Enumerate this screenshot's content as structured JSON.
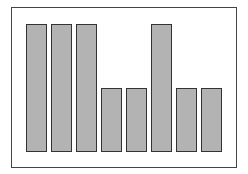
{
  "chart_data": {
    "type": "bar",
    "title": "",
    "xlabel": "",
    "ylabel": "",
    "categories": [
      "1",
      "2",
      "3",
      "4",
      "5",
      "6",
      "7",
      "8"
    ],
    "values": [
      2,
      2,
      2,
      1,
      1,
      2,
      1,
      1
    ],
    "ylim": [
      0,
      2
    ],
    "grid": false,
    "legend": null,
    "bar_color": "#b3b3b3",
    "edge_color": "#333333"
  }
}
